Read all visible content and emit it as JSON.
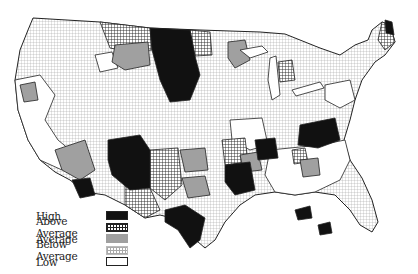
{
  "map": {
    "subject": "Contiguous United States regions",
    "colors": {
      "high": "#111111",
      "above_average": "#ffffff",
      "average": "#a0a0a0",
      "below_average": "#ffffff",
      "low": "#ffffff",
      "border": "#222222"
    }
  },
  "legend": {
    "items": [
      {
        "label": "High",
        "pattern": "solid-black"
      },
      {
        "label": "Above Average",
        "pattern": "dense-grid"
      },
      {
        "label": "Average",
        "pattern": "solid-gray"
      },
      {
        "label": "Below Average",
        "pattern": "light-grid"
      },
      {
        "label": "Low",
        "pattern": "white"
      }
    ]
  }
}
